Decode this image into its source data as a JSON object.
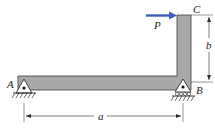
{
  "figure": {
    "type": "statics-frame-diagram"
  },
  "colors": {
    "beam_fill": "#a9a9ab",
    "beam_stroke": "#3c3c3c",
    "force_arrow": "#3a5fb8",
    "line": "#2a2a2a",
    "support_fill": "#ffffff"
  },
  "labels": {
    "point_a": "A",
    "point_b": "B",
    "point_c": "C",
    "force": "P",
    "dim_horizontal": "a",
    "dim_vertical": "b"
  },
  "supports": [
    {
      "point": "A",
      "type": "pin"
    },
    {
      "point": "B",
      "type": "pin-on-rollers"
    }
  ],
  "loads": [
    {
      "name": "P",
      "point": "C",
      "direction": "right"
    }
  ],
  "dimensions": [
    {
      "label": "a",
      "from": "A",
      "to": "B",
      "orientation": "horizontal"
    },
    {
      "label": "b",
      "from": "B",
      "to": "C",
      "orientation": "vertical"
    }
  ]
}
